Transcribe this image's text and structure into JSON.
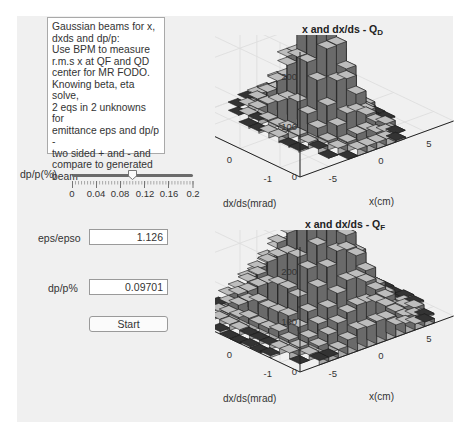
{
  "description": {
    "text": "Gaussian beams for x,\ndxds and dp/p:\nUse BPM to measure\nr.m.s x at QF and QD\ncenter for MR FODO.\nKnowing beta, eta solve,\n2 eqs in 2 unknowns for\nemittance eps and dp/p -\ntwo sided + and - and\ncompare to generated\nbeam"
  },
  "slider": {
    "label": "dp/p(%)",
    "min": 0,
    "max": 0.2,
    "value": 0.1,
    "tick_labels": [
      "0",
      "0.04",
      "0.08",
      "0.12",
      "0.16",
      "0.2"
    ]
  },
  "fields": {
    "eps_label": "eps/epso",
    "eps_value": "1.126",
    "dpp_label": "dp/p%",
    "dpp_value": "0.09701"
  },
  "buttons": {
    "start": "Start"
  },
  "plots": [
    {
      "title": "x and dx/ds - Q",
      "subscript": "D",
      "z_ticks": [
        "0",
        "100",
        "200"
      ],
      "y_ticks": [
        "1",
        "0",
        "-1"
      ],
      "x_ticks": [
        "-5",
        "0",
        "5"
      ],
      "ylabel": "dx/ds(mrad)",
      "xlabel": "x(cm)"
    },
    {
      "title": "x and dx/ds - Q",
      "subscript": "F",
      "z_ticks": [
        "0",
        "100",
        "200"
      ],
      "y_ticks": [
        "1",
        "0",
        "-1"
      ],
      "x_ticks": [
        "-5",
        "0",
        "5"
      ],
      "ylabel": "dx/ds(mrad)",
      "xlabel": "x(cm)"
    }
  ],
  "chart_data": [
    {
      "type": "bar3d",
      "title": "x and dx/ds - QD",
      "xlabel": "x(cm)",
      "ylabel": "dx/ds(mrad)",
      "zlabel": "",
      "xlim": [
        -8,
        8
      ],
      "ylim": [
        -1.5,
        1.5
      ],
      "zlim": [
        0,
        250
      ],
      "peak_count": 220,
      "distribution": "2D Gaussian histogram (narrow in x)"
    },
    {
      "type": "bar3d",
      "title": "x and dx/ds - QF",
      "xlabel": "x(cm)",
      "ylabel": "dx/ds(mrad)",
      "zlabel": "",
      "xlim": [
        -8,
        8
      ],
      "ylim": [
        -1.5,
        1.5
      ],
      "zlim": [
        0,
        250
      ],
      "peak_count": 230,
      "distribution": "2D Gaussian histogram (wider in x)"
    }
  ],
  "colors": {
    "panel_bg": "#f0f0f0",
    "bar_face": "#a8a8a8",
    "bar_side": "#6a6a6a",
    "bar_edge": "#1a1a1a",
    "grid": "#dcdcdc"
  }
}
